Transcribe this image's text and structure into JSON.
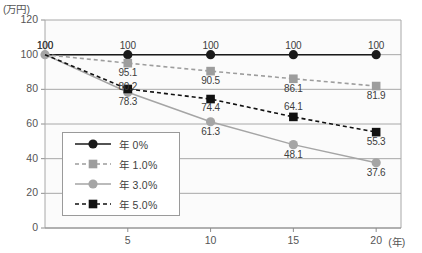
{
  "chart_data": {
    "type": "line",
    "title": "",
    "subtitle": "",
    "xlabel": "(年)",
    "ylabel": "(万円)",
    "x": [
      0,
      5,
      10,
      15,
      20
    ],
    "xtick_labels": [
      "5",
      "10",
      "15",
      "20"
    ],
    "xtick_values": [
      5,
      10,
      15,
      20
    ],
    "xlim": [
      0,
      21.5
    ],
    "ylim": [
      0,
      120
    ],
    "ytick_labels": [
      "0",
      "20",
      "40",
      "60",
      "80",
      "100",
      "120"
    ],
    "ytick_values": [
      0,
      20,
      40,
      60,
      80,
      100,
      120
    ],
    "grid": true,
    "legend_position": "lower-left-inside",
    "series": [
      {
        "name": "年 0%",
        "values": [
          100,
          100,
          100,
          100,
          100
        ],
        "color": "#1a1a1a",
        "marker": "circle",
        "linestyle": "solid",
        "labels": [
          "100",
          "100",
          "100",
          "100",
          "100"
        ]
      },
      {
        "name": "年 1.0%",
        "values": [
          100,
          95.1,
          90.5,
          86.1,
          81.9
        ],
        "color": "#9d9d9d",
        "marker": "square",
        "linestyle": "dashed",
        "labels": [
          "",
          "95.1",
          "90.5",
          "86.1",
          "81.9"
        ]
      },
      {
        "name": "年 3.0%",
        "values": [
          100,
          78.3,
          61.3,
          48.1,
          37.6
        ],
        "color": "#a5a5a5",
        "marker": "circle",
        "linestyle": "solid",
        "labels": [
          "",
          "78.3",
          "61.3",
          "48.1",
          "37.6"
        ]
      },
      {
        "name": "年 5.0%",
        "values": [
          100,
          80.2,
          74.4,
          64.1,
          55.3
        ],
        "color": "#111111",
        "marker": "square",
        "linestyle": "dashed",
        "labels": [
          "",
          "80.2",
          "74.4",
          "64.1",
          "55.3"
        ]
      }
    ],
    "annotations": [
      {
        "text": "100",
        "x": 0,
        "y": 100
      }
    ]
  },
  "legend": {
    "items": [
      {
        "label": "年 0%"
      },
      {
        "label": "年 1.0%"
      },
      {
        "label": "年 3.0%"
      },
      {
        "label": "年 5.0%"
      }
    ]
  },
  "axes": {
    "y_title": "(万円)",
    "x_unit": "(年)"
  }
}
